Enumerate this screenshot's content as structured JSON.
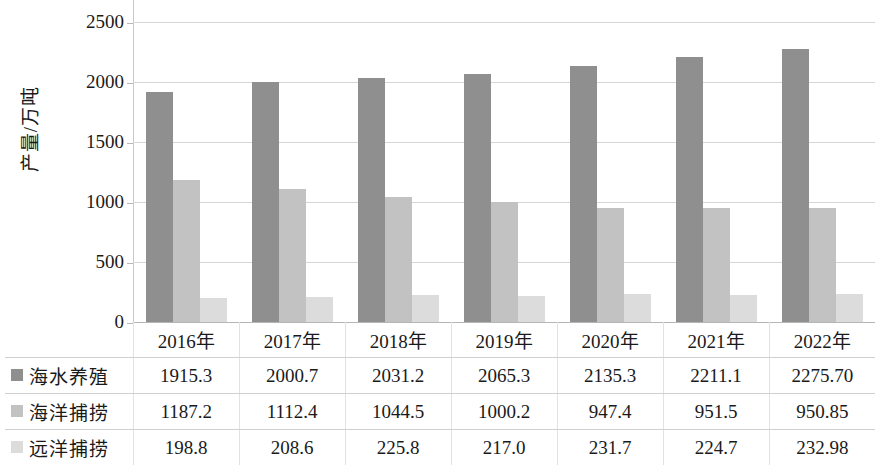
{
  "chart_data": {
    "type": "bar",
    "title": "",
    "subtitle": "",
    "xlabel": "",
    "ylabel": "产量/万吨",
    "categories": [
      "2016年",
      "2017年",
      "2018年",
      "2019年",
      "2020年",
      "2021年",
      "2022年"
    ],
    "series": [
      {
        "name": "海水养殖",
        "color": "#8f8f8f",
        "values": [
          1915.3,
          2000.7,
          2031.2,
          2065.3,
          2135.3,
          2211.1,
          2275.7
        ],
        "labels": [
          "1915.3",
          "2000.7",
          "2031.2",
          "2065.3",
          "2135.3",
          "2211.1",
          "2275.70"
        ]
      },
      {
        "name": "海洋捕捞",
        "color": "#c2c2c2",
        "values": [
          1187.2,
          1112.4,
          1044.5,
          1000.2,
          947.4,
          951.5,
          950.85
        ],
        "labels": [
          "1187.2",
          "1112.4",
          "1044.5",
          "1000.2",
          "947.4",
          "951.5",
          "950.85"
        ]
      },
      {
        "name": "远洋捕捞",
        "color": "#dcdcdc",
        "values": [
          198.8,
          208.6,
          225.8,
          217.0,
          231.7,
          224.7,
          232.98
        ],
        "labels": [
          "198.8",
          "208.6",
          "225.8",
          "217.0",
          "231.7",
          "224.7",
          "232.98"
        ]
      }
    ],
    "ylim": [
      0,
      2500
    ],
    "ytick_step": 500,
    "yticks": [
      0,
      500,
      1000,
      1500,
      2000,
      2500
    ],
    "ytick_labels": [
      "0",
      "500",
      "1000",
      "1500",
      "2000",
      "2500"
    ],
    "grid": true,
    "grid_axis": "y",
    "legend": "data-table",
    "legend_position": "table-left-column"
  },
  "table": {
    "corner_label": "",
    "column_headers": [
      "2016年",
      "2017年",
      "2018年",
      "2019年",
      "2020年",
      "2021年",
      "2022年"
    ],
    "rows": [
      {
        "label": "海水养殖",
        "swatch": "series-0-swatch",
        "cells": [
          "1915.3",
          "2000.7",
          "2031.2",
          "2065.3",
          "2135.3",
          "2211.1",
          "2275.70"
        ]
      },
      {
        "label": "海洋捕捞",
        "swatch": "series-1-swatch",
        "cells": [
          "1187.2",
          "1112.4",
          "1044.5",
          "1000.2",
          "947.4",
          "951.5",
          "950.85"
        ]
      },
      {
        "label": "远洋捕捞",
        "swatch": "series-2-swatch",
        "cells": [
          "198.8",
          "208.6",
          "225.8",
          "217.0",
          "231.7",
          "224.7",
          "232.98"
        ]
      }
    ]
  },
  "axis": {
    "ylabel": "产量/万吨",
    "ytick_labels": [
      "2500",
      "2000",
      "1500",
      "1000",
      "500",
      "0"
    ]
  },
  "colors": {
    "series_0": "#8f8f8f",
    "series_1": "#c2c2c2",
    "series_2": "#dcdcdc",
    "gridline": "#d6d6d6",
    "table_border": "#cfcfcf",
    "background": "#ffffff"
  }
}
